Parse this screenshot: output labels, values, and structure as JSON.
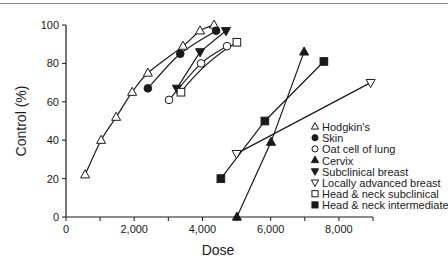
{
  "chart_data": {
    "type": "scatter",
    "title": "",
    "xlabel": "Dose",
    "ylabel": "Control (%)",
    "xlim": [
      0,
      9000
    ],
    "ylim": [
      0,
      100
    ],
    "x_ticks": [
      0,
      1000,
      2000,
      3000,
      4000,
      5000,
      6000,
      7000,
      8000,
      9000
    ],
    "x_tick_labels": [
      {
        "value": 0,
        "label": "0"
      },
      {
        "value": 2000,
        "label": "2,000"
      },
      {
        "value": 4000,
        "label": "4,000"
      },
      {
        "value": 6000,
        "label": "6,000"
      },
      {
        "value": 8000,
        "label": "8,000"
      }
    ],
    "y_ticks": [
      0,
      20,
      40,
      60,
      80,
      100
    ],
    "y_tick_labels": [
      "0",
      "20",
      "40",
      "60",
      "80",
      "100"
    ],
    "grid": false,
    "legend_position": "lower right (inside plot)",
    "series": [
      {
        "name": "Hodgkin's",
        "marker": "open-triangle-up",
        "line": "curve",
        "points": [
          [
            560,
            22
          ],
          [
            1030,
            40
          ],
          [
            1470,
            52
          ],
          [
            1940,
            65
          ],
          [
            2400,
            75
          ],
          [
            3430,
            89
          ],
          [
            3930,
            97
          ],
          [
            4340,
            100
          ]
        ]
      },
      {
        "name": "Skin",
        "marker": "filled-circle",
        "line": "curve",
        "points": [
          [
            2400,
            67
          ],
          [
            3350,
            85
          ],
          [
            4400,
            97
          ]
        ]
      },
      {
        "name": "Oat cell of lung",
        "marker": "open-circle",
        "line": "curve",
        "points": [
          [
            3020,
            61
          ],
          [
            3960,
            80
          ],
          [
            4720,
            89
          ]
        ]
      },
      {
        "name": "Cervix",
        "marker": "filled-triangle-up",
        "line": "straight",
        "points": [
          [
            5010,
            0
          ],
          [
            6010,
            39
          ],
          [
            6980,
            86
          ]
        ]
      },
      {
        "name": "Subclinical breast",
        "marker": "filled-triangle-down",
        "line": "straight",
        "points": [
          [
            3250,
            67
          ],
          [
            3930,
            86
          ],
          [
            4690,
            97
          ]
        ]
      },
      {
        "name": "Locally advanced breast",
        "marker": "open-triangle-down",
        "line": "straight",
        "points": [
          [
            5000,
            33
          ],
          [
            8930,
            70
          ]
        ]
      },
      {
        "name": "Head & neck subclinical",
        "marker": "open-square",
        "line": "curve",
        "points": [
          [
            3370,
            65
          ],
          [
            5010,
            91
          ]
        ]
      },
      {
        "name": "Head & neck intermediate",
        "marker": "filled-square",
        "line": "straight",
        "points": [
          [
            4540,
            20
          ],
          [
            5830,
            50
          ],
          [
            7560,
            81
          ]
        ]
      }
    ]
  },
  "axes": {
    "xlabel": "Dose",
    "ylabel": "Control (%)"
  },
  "legend": {
    "items": [
      {
        "label": "Hodgkin's",
        "symbol": "△"
      },
      {
        "label": "Skin",
        "symbol": "●"
      },
      {
        "label": "Oat cell of lung",
        "symbol": "○"
      },
      {
        "label": "Cervix",
        "symbol": "▲"
      },
      {
        "label": "Subclinical breast",
        "symbol": "▼"
      },
      {
        "label": "Locally advanced breast",
        "symbol": "▽"
      },
      {
        "label": "Head & neck subclinical",
        "symbol": "□"
      },
      {
        "label": "Head & neck intermediate",
        "symbol": "■"
      }
    ]
  }
}
